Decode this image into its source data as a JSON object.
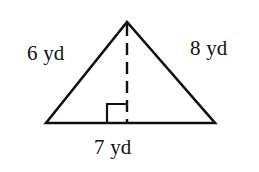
{
  "figure": {
    "kind": "geometry-triangle-diagram",
    "background_color": "#ffffff",
    "stroke_color": "#101010",
    "unit": "yd",
    "labels": {
      "left_side": "6 yd",
      "right_side": "8 yd",
      "base": "7 yd"
    },
    "measurements": {
      "left_side_value": 6,
      "right_side_value": 8,
      "base_value": 7
    },
    "geometry": {
      "apex": {
        "x": 127,
        "y": 22
      },
      "bottom_left": {
        "x": 46,
        "y": 123
      },
      "bottom_right": {
        "x": 215,
        "y": 123
      },
      "altitude_foot": {
        "x": 127,
        "y": 123
      },
      "right_angle_marker": {
        "x": 107,
        "y": 104,
        "size": 19,
        "side": "left-of-altitude"
      },
      "altitude_dash_pattern": "12 7",
      "outline_stroke_width": 2.6,
      "altitude_stroke_width": 2.4,
      "marker_stroke_width": 2.2
    }
  }
}
